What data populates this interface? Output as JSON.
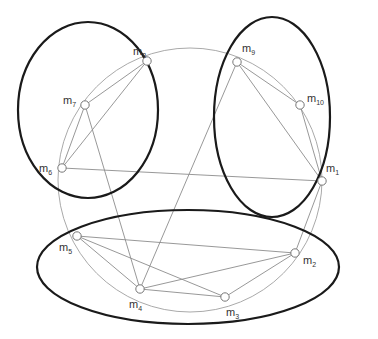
{
  "diagram": {
    "type": "network-graph",
    "circle": {
      "cx": 190,
      "cy": 180,
      "r": 132,
      "color": "#aaaaaa"
    },
    "clusters": [
      {
        "id": "left",
        "cx": 88,
        "cy": 110,
        "rx": 70,
        "ry": 88,
        "members": [
          "m6",
          "m7",
          "m8"
        ]
      },
      {
        "id": "right",
        "cx": 272,
        "cy": 117,
        "rx": 58,
        "ry": 100,
        "members": [
          "m9",
          "m10",
          "m1"
        ]
      },
      {
        "id": "bottom",
        "cx": 188,
        "cy": 267,
        "rx": 151,
        "ry": 57,
        "members": [
          "m2",
          "m3",
          "m4",
          "m5"
        ]
      }
    ],
    "nodes": [
      {
        "id": "m1",
        "base": "m",
        "sub": "1",
        "x": 322,
        "y": 181,
        "lx": 326,
        "ly": 172
      },
      {
        "id": "m2",
        "base": "m",
        "sub": "2",
        "x": 295,
        "y": 253,
        "lx": 303,
        "ly": 264
      },
      {
        "id": "m3",
        "base": "m",
        "sub": "3",
        "x": 225,
        "y": 297,
        "lx": 226,
        "ly": 316
      },
      {
        "id": "m4",
        "base": "m",
        "sub": "4",
        "x": 140,
        "y": 289,
        "lx": 129,
        "ly": 308
      },
      {
        "id": "m5",
        "base": "m",
        "sub": "5",
        "x": 77,
        "y": 236,
        "lx": 59,
        "ly": 251
      },
      {
        "id": "m6",
        "base": "m",
        "sub": "6",
        "x": 62,
        "y": 168,
        "lx": 39,
        "ly": 172
      },
      {
        "id": "m7",
        "base": "m",
        "sub": "7",
        "x": 85,
        "y": 105,
        "lx": 63,
        "ly": 104
      },
      {
        "id": "m8",
        "base": "m",
        "sub": "8",
        "x": 147,
        "y": 61,
        "lx": 133,
        "ly": 55
      },
      {
        "id": "m9",
        "base": "m",
        "sub": "9",
        "x": 237,
        "y": 62,
        "lx": 242,
        "ly": 52
      },
      {
        "id": "m10",
        "base": "m",
        "sub": "10",
        "x": 300,
        "y": 105,
        "lx": 307,
        "ly": 102
      }
    ],
    "edges": [
      [
        "m8",
        "m7"
      ],
      [
        "m8",
        "m6"
      ],
      [
        "m7",
        "m6"
      ],
      [
        "m7",
        "m4"
      ],
      [
        "m6",
        "m1"
      ],
      [
        "m9",
        "m10"
      ],
      [
        "m9",
        "m1"
      ],
      [
        "m10",
        "m1"
      ],
      [
        "m9",
        "m4"
      ],
      [
        "m5",
        "m2"
      ],
      [
        "m5",
        "m3"
      ],
      [
        "m5",
        "m4"
      ],
      [
        "m4",
        "m2"
      ],
      [
        "m4",
        "m3"
      ],
      [
        "m3",
        "m2"
      ],
      [
        "m2",
        "m1"
      ]
    ],
    "colors": {
      "cluster_stroke": "#1a1a1a",
      "edge_stroke": "#8c8c8c",
      "node_fill": "#ffffff",
      "node_stroke": "#777777",
      "label": "#333333"
    }
  }
}
